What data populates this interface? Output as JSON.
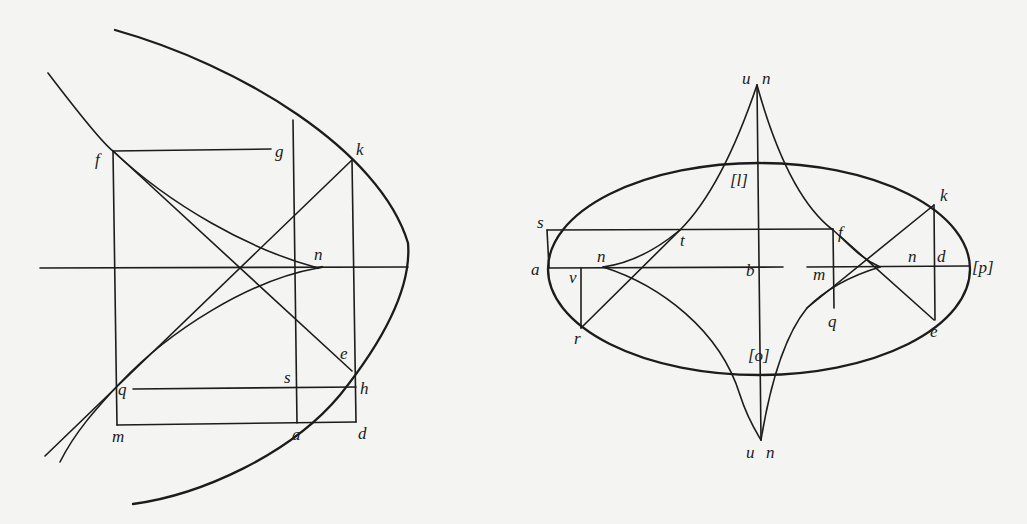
{
  "figures": {
    "left": {
      "title": "Parabola with its evolute (semicubical parabola)",
      "labels": {
        "f": "f",
        "g": "g",
        "k": "k",
        "n": "n",
        "e": "e",
        "s": "s",
        "h": "h",
        "q": "q",
        "m": "m",
        "a": "a",
        "d": "d"
      }
    },
    "right": {
      "title": "Ellipse with its evolute (astroid-like curve)",
      "labels": {
        "u_top": "u",
        "n_top": "n",
        "l": "[l]",
        "s": "s",
        "t": "t",
        "f": "f",
        "k": "k",
        "a": "a",
        "v": "v",
        "n_left": "n",
        "b": "b",
        "m": "m",
        "n_right": "n",
        "d": "d",
        "p": "[p]",
        "r": "r",
        "q": "q",
        "e": "e",
        "o": "[o]",
        "u_bottom": "u",
        "n_bottom": "n"
      }
    }
  },
  "colors": {
    "ink": "#1c1c1c",
    "paper": "#f4f4f2",
    "bleed_through": "#d9d9d6"
  }
}
